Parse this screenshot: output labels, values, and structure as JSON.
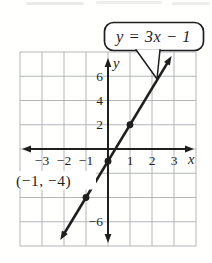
{
  "figure": {
    "equation_callout": "y = 3x − 1",
    "point_label": "(−1, −4)",
    "x_axis_letter": "x",
    "y_axis_letter": "y",
    "colors": {
      "ink": "#1f1f1f",
      "grid": "#b2b6b8",
      "background": "#ffffff",
      "callout_fill": "#ffffff"
    }
  },
  "chart_data": {
    "type": "line",
    "equation": "y = 3x − 1",
    "slope": 3,
    "y_intercept": -1,
    "line_x_range": [
      -2.17,
      2.89
    ],
    "marked_points": [
      [
        -1,
        -4
      ],
      [
        0,
        -1
      ],
      [
        1,
        2
      ]
    ],
    "annotated_point": [
      -1,
      -4
    ],
    "annotated_point_label": "(−1, −4)",
    "x_ticks": [
      -3,
      -2,
      -1,
      1,
      2,
      3
    ],
    "x_tick_labels": [
      "−3",
      "−2",
      "−1",
      "1",
      "2",
      "3"
    ],
    "y_ticks": [
      6,
      4,
      2,
      -6
    ],
    "y_tick_labels": [
      "6",
      "4",
      "2",
      "−6"
    ],
    "xlabel": "x",
    "ylabel": "y",
    "xlim": [
      -4,
      4
    ],
    "ylim": [
      -8,
      8
    ],
    "x_grid_step": 1,
    "y_grid_step": 2,
    "grid": true,
    "legend_position": "none"
  }
}
